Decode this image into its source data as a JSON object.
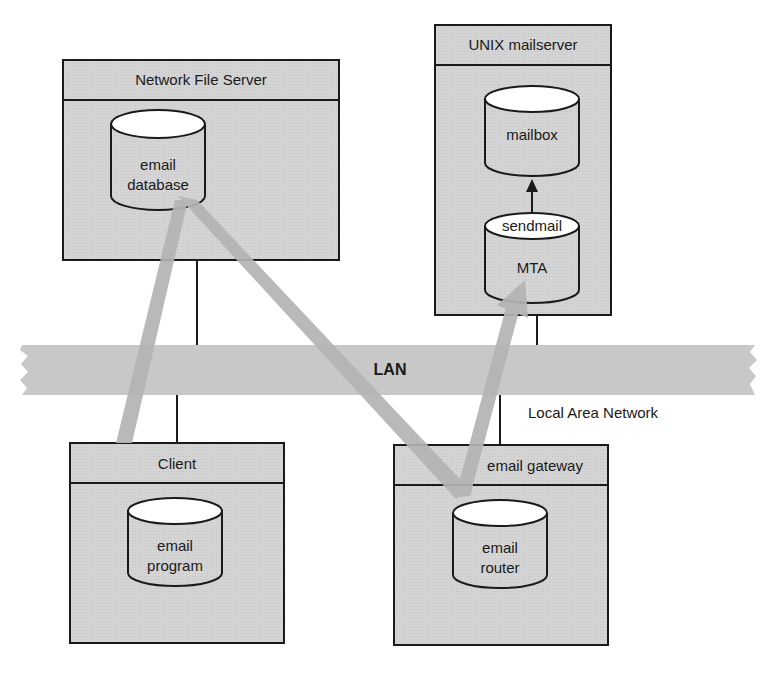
{
  "diagram": {
    "network": {
      "label": "LAN",
      "caption": "Local Area Network"
    },
    "nodes": {
      "file_server": {
        "title": "Network File Server",
        "component": "email database"
      },
      "mailserver": {
        "title": "UNIX mailserver",
        "mailbox": "mailbox",
        "mta_top": "sendmail",
        "mta": "MTA"
      },
      "client": {
        "title": "Client",
        "component": "email program"
      },
      "gateway": {
        "title": "email gateway",
        "component": "email router"
      }
    },
    "labels": {
      "db_line1": "email",
      "db_line2": "database",
      "prog_line1": "email",
      "prog_line2": "program",
      "router_line1": "email",
      "router_line2": "router"
    },
    "colors": {
      "box_fill": "#d2d2d2",
      "header_fill": "#d6d6d6",
      "lan_fill": "#c8c8c8",
      "flow_arrow": "#b4b4b4",
      "stroke": "#1a1a1a"
    }
  }
}
